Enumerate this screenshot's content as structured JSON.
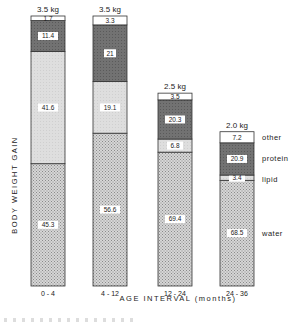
{
  "chart_data": {
    "type": "bar",
    "stacked": true,
    "title": "",
    "xlabel": "AGE INTERVAL (months)",
    "ylabel": "BODY WEIGHT GAIN",
    "categories": [
      "0-4",
      "4-12",
      "12-24",
      "24-36"
    ],
    "totals": [
      "3.5 kg",
      "3.5 kg",
      "2.5 kg",
      "2.0 kg"
    ],
    "total_values": [
      3.5,
      3.5,
      2.5,
      2.0
    ],
    "unit_of_segments": "percent of weight gain",
    "series": [
      {
        "name": "water",
        "values": [
          45.3,
          56.6,
          69.4,
          68.5
        ],
        "color": "#c9c9c9",
        "pattern": "dotted"
      },
      {
        "name": "lipid",
        "values": [
          41.6,
          19.1,
          6.8,
          3.4
        ],
        "color": "#dcdcdc",
        "pattern": "light"
      },
      {
        "name": "protein",
        "values": [
          11.4,
          21.0,
          20.3,
          20.9
        ],
        "color": "#6f6f6f",
        "pattern": "dark"
      },
      {
        "name": "other",
        "values": [
          1.7,
          3.3,
          3.5,
          7.2
        ],
        "color": "#ffffff",
        "pattern": "none"
      }
    ],
    "legend": [
      "other",
      "protein",
      "lipid",
      "water"
    ],
    "legend_position": "right",
    "grid": false
  }
}
